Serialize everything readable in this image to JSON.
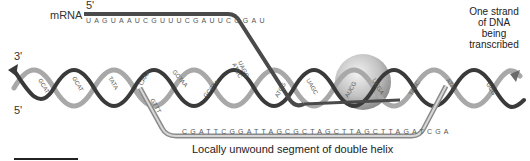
{
  "diagram": {
    "type": "dna-transcription",
    "labels": {
      "mrna": "mRNA",
      "mrna_five_prime": "5'",
      "dna_three_prime": "3'",
      "dna_five_prime": "5'",
      "template_strand_note": [
        "One strand",
        "of DNA",
        "being",
        "transcribed"
      ],
      "unwound_caption": "Locally unwound segment of double helix"
    },
    "sequences": {
      "mrna": "UAGUAAUCGUUUCGAUUCGGAU",
      "unwound_dna_strand": "CGATTCGGATTAGCGCTAGCTTAGCTTAGATCGA",
      "helix_pairs_left": [
        "GC",
        "CG",
        "AT",
        "TA",
        "GC",
        "CG",
        "TA",
        "AT",
        "TA",
        "AT"
      ],
      "helix_bases_mid": [
        "CAAA",
        "GTTT",
        "GCTAA",
        "GCCTA"
      ],
      "rna_dna_hybrid": [
        "UAGG",
        "ATCC",
        "UAGC",
        "ATCG"
      ],
      "helix_pairs_right": [
        "TA",
        "AT",
        "AT",
        "TA",
        "GC",
        "CG"
      ]
    },
    "colors": {
      "strand_dark": "#3a3a3a",
      "strand_light": "#9a9a9a",
      "mrna": "#444444",
      "polymerase": "#c8c8c8",
      "text": "#333333"
    }
  }
}
